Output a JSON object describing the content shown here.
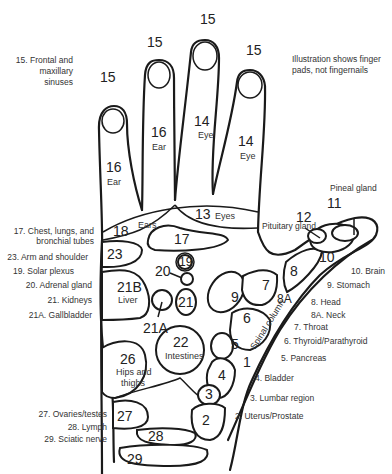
{
  "note": {
    "line1": "Illustration shows finger",
    "line2": "pads, not fingernails"
  },
  "sinus_legend": {
    "line1": "15. Frontal and",
    "line2": "maxillary",
    "line3": "sinuses"
  },
  "finger_labels": {
    "pad": "15",
    "ear_num": "16",
    "ear": "Ear",
    "eye_num": "14",
    "eye": "Eye"
  },
  "palm_zones": {
    "z18": "18",
    "z18_label": "Ears",
    "z13": "13",
    "z13_label": "Eyes",
    "z17": "17",
    "z23": "23",
    "z21b": "21B",
    "z21b_label": "Liver",
    "z19": "19",
    "z20": "20",
    "z21": "21",
    "z21a": "21A",
    "z22": "22",
    "z22_label": "Intestines",
    "z26": "26",
    "z26_label1": "Hips and",
    "z26_label2": "thighs",
    "z27": "27",
    "z28": "28",
    "z29": "29",
    "z9": "9",
    "z7": "7",
    "z8": "8",
    "z8a": "8A",
    "z6": "6",
    "z5": "5",
    "z4": "4",
    "z3": "3",
    "z2": "2",
    "z1": "1",
    "z10": "10",
    "z11": "11",
    "z12": "12",
    "spinal": "Spinal column",
    "pineal": "Pineal gland",
    "pituitary": "Pituitary gland"
  },
  "left_legend": [
    {
      "line1": "17. Chest, lungs, and",
      "line2": "bronchial tubes"
    },
    {
      "text": "23. Arm and shoulder"
    },
    {
      "text": "19. Solar plexus"
    },
    {
      "text": "20. Adrenal gland"
    },
    {
      "text": "21. Kidneys"
    },
    {
      "text": "21A. Gallbladder"
    },
    {
      "text": "27. Ovaries/testes"
    },
    {
      "text": "28. Lymph"
    },
    {
      "text": "29.  Sciatic nerve"
    }
  ],
  "right_legend": [
    {
      "text": "10. Brain"
    },
    {
      "text": "9. Stomach"
    },
    {
      "text": "8. Head"
    },
    {
      "text": "8A. Neck"
    },
    {
      "text": "7. Throat"
    },
    {
      "text": "6. Thyroid/Parathyroid"
    },
    {
      "text": "5. Pancreas"
    },
    {
      "text": "4. Bladder"
    },
    {
      "text": "3. Lumbar region"
    },
    {
      "text": "2. Uterus/Prostate"
    }
  ]
}
